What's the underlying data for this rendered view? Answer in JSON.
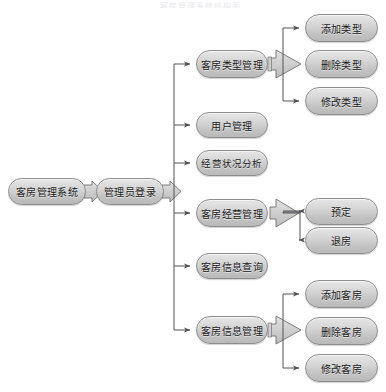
{
  "diagram": {
    "type": "tree-flow-diagram",
    "top_artifact_text": "客房管理系统结构图",
    "palette": {
      "node_border": "#8d8d8d",
      "node_fill_top": "#e6e6e6",
      "node_fill_bottom": "#b9b9b9",
      "connector_line": "#55555a",
      "block_arrow_fill": "#cfcfcf",
      "block_arrow_border": "#6f6f6f",
      "text": "#1a1a1a",
      "background": "#ffffff"
    },
    "nodes": [
      {
        "id": "root",
        "label": "客房管理系统",
        "x": 8,
        "y": 178,
        "w": 78,
        "h": 27
      },
      {
        "id": "login",
        "label": "管理员登录",
        "x": 96,
        "y": 178,
        "w": 68,
        "h": 27
      },
      {
        "id": "room_type_mgmt",
        "label": "客房类型管理",
        "x": 196,
        "y": 50,
        "w": 72,
        "h": 28
      },
      {
        "id": "user_mgmt",
        "label": "用户管理",
        "x": 196,
        "y": 112,
        "w": 72,
        "h": 26
      },
      {
        "id": "biz_analysis",
        "label": "经营状况分析",
        "x": 196,
        "y": 150,
        "w": 72,
        "h": 26
      },
      {
        "id": "room_biz_mgmt",
        "label": "客房经营管理",
        "x": 196,
        "y": 199,
        "w": 72,
        "h": 28
      },
      {
        "id": "room_info_query",
        "label": "客房信息查询",
        "x": 196,
        "y": 253,
        "w": 72,
        "h": 26
      },
      {
        "id": "room_info_mgmt",
        "label": "客房信息管理",
        "x": 196,
        "y": 316,
        "w": 72,
        "h": 28
      },
      {
        "id": "add_type",
        "label": "添加类型",
        "x": 305,
        "y": 14,
        "w": 73,
        "h": 28
      },
      {
        "id": "del_type",
        "label": "删除类型",
        "x": 305,
        "y": 50,
        "w": 73,
        "h": 28
      },
      {
        "id": "mod_type",
        "label": "修改类型",
        "x": 305,
        "y": 87,
        "w": 73,
        "h": 28
      },
      {
        "id": "reserve",
        "label": "预定",
        "x": 305,
        "y": 198,
        "w": 73,
        "h": 27
      },
      {
        "id": "checkout",
        "label": "退房",
        "x": 305,
        "y": 227,
        "w": 73,
        "h": 27
      },
      {
        "id": "add_room",
        "label": "添加客房",
        "x": 305,
        "y": 280,
        "w": 73,
        "h": 28
      },
      {
        "id": "del_room",
        "label": "删除客房",
        "x": 305,
        "y": 317,
        "w": 73,
        "h": 28
      },
      {
        "id": "mod_room",
        "label": "修改客房",
        "x": 305,
        "y": 354,
        "w": 73,
        "h": 28
      }
    ],
    "connectors": [
      {
        "id": "root-to-login",
        "kind": "block-arrow",
        "from": "root",
        "to": "login"
      },
      {
        "id": "login-to-branch",
        "kind": "block-arrow",
        "from": "login",
        "to": "trunk"
      },
      {
        "id": "roomtype-to-children",
        "kind": "block-arrow",
        "from": "room_type_mgmt",
        "to": "del_type"
      },
      {
        "id": "roombiz-to-children",
        "kind": "block-arrow",
        "from": "room_biz_mgmt",
        "to": "reserve-checkout"
      },
      {
        "id": "roominfo-to-children",
        "kind": "block-arrow",
        "from": "room_info_mgmt",
        "to": "del_room"
      },
      {
        "id": "trunk-to-room_type_mgmt",
        "kind": "line-arrow",
        "from": "trunk",
        "to": "room_type_mgmt"
      },
      {
        "id": "trunk-to-user_mgmt",
        "kind": "line-arrow",
        "from": "trunk",
        "to": "user_mgmt"
      },
      {
        "id": "trunk-to-biz_analysis",
        "kind": "line-arrow",
        "from": "trunk",
        "to": "biz_analysis"
      },
      {
        "id": "trunk-to-room_biz_mgmt",
        "kind": "line-arrow",
        "from": "trunk",
        "to": "room_biz_mgmt"
      },
      {
        "id": "trunk-to-room_info_query",
        "kind": "line-arrow",
        "from": "trunk",
        "to": "room_info_query"
      },
      {
        "id": "trunk-to-room_info_mgmt",
        "kind": "line-arrow",
        "from": "trunk",
        "to": "room_info_mgmt"
      },
      {
        "id": "branch-to-add_type",
        "kind": "line-arrow",
        "from": "room_type_mgmt",
        "to": "add_type"
      },
      {
        "id": "branch-to-mod_type",
        "kind": "line-arrow",
        "from": "room_type_mgmt",
        "to": "mod_type"
      },
      {
        "id": "branch-to-reserve",
        "kind": "line-arrow",
        "from": "room_biz_mgmt",
        "to": "reserve"
      },
      {
        "id": "branch-to-checkout",
        "kind": "line-arrow",
        "from": "room_biz_mgmt",
        "to": "checkout"
      },
      {
        "id": "branch-to-add_room",
        "kind": "line-arrow",
        "from": "room_info_mgmt",
        "to": "add_room"
      },
      {
        "id": "branch-to-mod_room",
        "kind": "line-arrow",
        "from": "room_info_mgmt",
        "to": "mod_room"
      }
    ]
  }
}
